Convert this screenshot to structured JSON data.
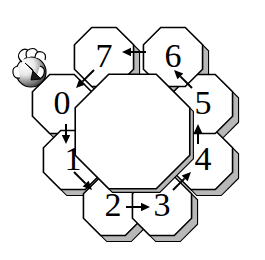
{
  "figure": {
    "name": "octagon-ring-diagram",
    "background_color": "#ffffff",
    "line_color": "#000000",
    "shadow_color": "#b8b8b8",
    "face_color": "#ffffff",
    "width": 265,
    "height": 260
  },
  "marker": {
    "name": "start-token",
    "label": "",
    "position": "top-left",
    "description": "shaded-sphere-with-swirl"
  },
  "cells": [
    {
      "id": "cell-0",
      "label": "0",
      "cx": 62,
      "cy": 104,
      "angle_deg": 180
    },
    {
      "id": "cell-1",
      "label": "1",
      "cx": 73,
      "cy": 160,
      "angle_deg": 225
    },
    {
      "id": "cell-2",
      "label": "2",
      "cx": 113,
      "cy": 206,
      "angle_deg": 270
    },
    {
      "id": "cell-3",
      "label": "3",
      "cx": 162,
      "cy": 206,
      "angle_deg": 315
    },
    {
      "id": "cell-4",
      "label": "4",
      "cx": 203,
      "cy": 160,
      "angle_deg": 0
    },
    {
      "id": "cell-5",
      "label": "5",
      "cx": 203,
      "cy": 104,
      "angle_deg": 45
    },
    {
      "id": "cell-6",
      "label": "6",
      "cx": 173,
      "cy": 57,
      "angle_deg": 90
    },
    {
      "id": "cell-7",
      "label": "7",
      "cx": 104,
      "cy": 57,
      "angle_deg": 135
    }
  ],
  "arrows": [
    {
      "id": "arrow-0-1",
      "from": "0",
      "to": "1",
      "direction": "down",
      "x1": 66,
      "y1": 124,
      "x2": 66,
      "y2": 144
    },
    {
      "id": "arrow-1-2",
      "from": "1",
      "to": "2",
      "direction": "down-right",
      "x1": 74,
      "y1": 172,
      "x2": 92,
      "y2": 190
    },
    {
      "id": "arrow-2-3",
      "from": "2",
      "to": "3",
      "direction": "right",
      "x1": 126,
      "y1": 207,
      "x2": 150,
      "y2": 207
    },
    {
      "id": "arrow-3-4",
      "from": "3",
      "to": "4",
      "direction": "up-right",
      "x1": 173,
      "y1": 190,
      "x2": 191,
      "y2": 172
    },
    {
      "id": "arrow-4-5",
      "from": "4",
      "to": "5",
      "direction": "up",
      "x1": 198,
      "y1": 144,
      "x2": 198,
      "y2": 124
    },
    {
      "id": "arrow-5-6",
      "from": "5",
      "to": "6",
      "direction": "up-left",
      "x1": 192,
      "y1": 88,
      "x2": 174,
      "y2": 70
    },
    {
      "id": "arrow-6-7",
      "from": "6",
      "to": "7",
      "direction": "left",
      "x1": 146,
      "y1": 52,
      "x2": 122,
      "y2": 52
    },
    {
      "id": "arrow-7-0",
      "from": "7",
      "to": "0",
      "direction": "down-left",
      "x1": 94,
      "y1": 70,
      "x2": 76,
      "y2": 88
    }
  ],
  "center_void": {
    "name": "central-octagonal-hole",
    "label": ""
  }
}
